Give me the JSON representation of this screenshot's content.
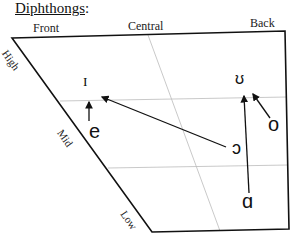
{
  "title": "Diphthongs",
  "title_suffix": ":",
  "columns": {
    "front": "Front",
    "central": "Central",
    "back": "Back"
  },
  "rows": {
    "high": "High",
    "mid": "Mid",
    "low": "Low"
  },
  "vowels": {
    "I": "ɪ",
    "e": "e",
    "U": "ʊ",
    "o": "o",
    "open_o": "ɔ",
    "a": "ɑ"
  },
  "diphthongs": [
    {
      "from": "e",
      "to": "ɪ"
    },
    {
      "from": "ɔ",
      "to": "ɪ"
    },
    {
      "from": "ɑ",
      "to": "ʊ"
    },
    {
      "from": "o",
      "to": "ʊ"
    }
  ]
}
